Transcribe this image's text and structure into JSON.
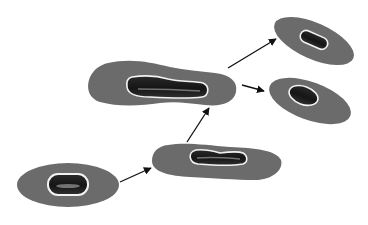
{
  "caption": {
    "text": "",
    "legible": false
  },
  "colors": {
    "background": "#ffffff",
    "cytoplasm": "#6b6b6b",
    "nucleus_outline": "#f2f2f2",
    "nucleus_fill": "#1f1f1f",
    "nucleus_highlight": "#8a8a8a",
    "arrow": "#111111"
  },
  "diagram": {
    "type": "cell-division-sequence",
    "stages": [
      {
        "id": "cell-1",
        "shape": "oval",
        "nucleus": "small-oval"
      },
      {
        "id": "cell-2",
        "shape": "elongated",
        "nucleus": "elongated"
      },
      {
        "id": "cell-3",
        "shape": "peanut",
        "nucleus": "elongated-constricted"
      },
      {
        "id": "cell-4",
        "shape": "tilted-oval",
        "nucleus": "small-oval"
      },
      {
        "id": "cell-5",
        "shape": "tilted-oval",
        "nucleus": "small-oval"
      }
    ],
    "arrows": [
      {
        "from": "cell-1",
        "to": "cell-2"
      },
      {
        "from": "cell-2",
        "to": "cell-3"
      },
      {
        "from": "cell-3",
        "to": "cell-4"
      },
      {
        "from": "cell-3",
        "to": "cell-5"
      }
    ]
  }
}
